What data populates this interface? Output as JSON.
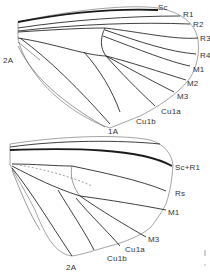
{
  "figure": {
    "forewing": {
      "labels": {
        "sc": "Sc",
        "r1": "R1",
        "r2": "R2",
        "r3": "R3",
        "r4": "R4",
        "m1": "M1",
        "m2": "M2",
        "m3": "M3",
        "cu1a": "Cu1a",
        "cu1b": "Cu1b",
        "a1": "1A",
        "a2": "2A"
      }
    },
    "hindwing": {
      "labels": {
        "scr1": "Sc+R1",
        "rs": "Rs",
        "m1": "M1",
        "m3": "M3",
        "cu1a": "Cu1a",
        "cu1b": "Cu1b",
        "a2": "2A"
      }
    },
    "colors": {
      "vein": "#2a2a2a",
      "margin": "#666666",
      "background": "#ffffff"
    }
  }
}
